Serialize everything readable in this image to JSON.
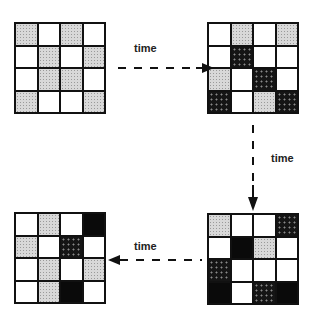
{
  "diagram": {
    "legend": {
      "W": "white cell",
      "G": "light gray stippled cell",
      "D": "dark dotted cell",
      "B": "solid black cell"
    },
    "grids": [
      {
        "id": "state-1",
        "position": "top-left",
        "cells": [
          [
            "G",
            "W",
            "G",
            "W"
          ],
          [
            "W",
            "G",
            "W",
            "G"
          ],
          [
            "W",
            "G",
            "G",
            "W"
          ],
          [
            "G",
            "W",
            "W",
            "G"
          ]
        ]
      },
      {
        "id": "state-2",
        "position": "top-right",
        "cells": [
          [
            "W",
            "G",
            "W",
            "G"
          ],
          [
            "W",
            "D",
            "W",
            "W"
          ],
          [
            "G",
            "W",
            "D",
            "W"
          ],
          [
            "D",
            "W",
            "G",
            "D"
          ]
        ]
      },
      {
        "id": "state-3",
        "position": "bottom-right",
        "cells": [
          [
            "G",
            "W",
            "W",
            "D"
          ],
          [
            "W",
            "B",
            "G",
            "W"
          ],
          [
            "D",
            "W",
            "W",
            "W"
          ],
          [
            "B",
            "W",
            "D",
            "B"
          ]
        ]
      },
      {
        "id": "state-4",
        "position": "bottom-left",
        "cells": [
          [
            "W",
            "G",
            "W",
            "B"
          ],
          [
            "G",
            "W",
            "D",
            "W"
          ],
          [
            "W",
            "G",
            "W",
            "G"
          ],
          [
            "W",
            "G",
            "B",
            "W"
          ]
        ]
      }
    ],
    "arrows": [
      {
        "from": "state-1",
        "to": "state-2",
        "direction": "right",
        "label": "time"
      },
      {
        "from": "state-2",
        "to": "state-3",
        "direction": "down",
        "label": "time"
      },
      {
        "from": "state-3",
        "to": "state-4",
        "direction": "left",
        "label": "time"
      }
    ]
  }
}
